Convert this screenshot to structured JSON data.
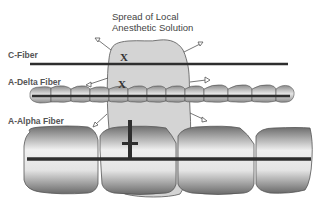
{
  "title": {
    "line1": "Spread of Local",
    "line2": "Anesthetic Solution"
  },
  "fibers": [
    {
      "name": "C-Fiber",
      "type": "unmyelinated",
      "block_marker": "X"
    },
    {
      "name": "A-Delta Fiber",
      "type": "thin myelinated",
      "block_marker": "X"
    },
    {
      "name": "A-Alpha Fiber",
      "type": "thick myelinated",
      "block_marker": "node-of-ranvier"
    }
  ],
  "colors": {
    "solution_fill": "#d4d4d4",
    "axon": "#2e2e2e",
    "myelin_light": "#ececec",
    "myelin_dark": "#7a7a7a",
    "outline": "#555555"
  }
}
